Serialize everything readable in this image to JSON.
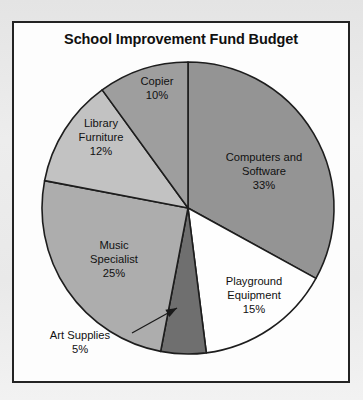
{
  "page": {
    "background_color": "#e9e9e9",
    "frame_background": "#fdfdfd",
    "frame_border_color": "#232323"
  },
  "chart_title": "School Improvement Fund Budget",
  "chart_data": {
    "type": "pie",
    "title": "School Improvement Fund Budget",
    "xlabel": "",
    "ylabel": "",
    "legend_position": "none",
    "grid": false,
    "total": 100,
    "units": "percent",
    "start_angle_deg": 0,
    "direction": "clockwise",
    "categories": [
      "Computers and Software",
      "Playground Equipment",
      "Art Supplies",
      "Music Specialist",
      "Library Furniture",
      "Copier"
    ],
    "values": [
      33,
      15,
      5,
      25,
      12,
      10
    ],
    "slices": [
      {
        "label": "Computers and",
        "label_line2": "Software",
        "full_label": "Computers and Software",
        "value": 33,
        "value_text": "33%",
        "color": "#949494",
        "label_placement": "inside",
        "label_x": 250,
        "label_y": 138
      },
      {
        "label": "Playground",
        "label_line2": "Equipment",
        "full_label": "Playground Equipment",
        "value": 15,
        "value_text": "15%",
        "color": "#fefefe",
        "label_placement": "inside",
        "label_x": 240,
        "label_y": 262
      },
      {
        "label": "Art Supplies",
        "label_line2": "",
        "full_label": "Art Supplies",
        "value": 5,
        "value_text": "5%",
        "color": "#6f6f6f",
        "label_placement": "callout",
        "label_x": 66,
        "label_y": 316
      },
      {
        "label": "Music",
        "label_line2": "Specialist",
        "full_label": "Music Specialist",
        "value": 25,
        "value_text": "25%",
        "color": "#adadad",
        "label_placement": "inside",
        "label_x": 100,
        "label_y": 226
      },
      {
        "label": "Library",
        "label_line2": "Furniture",
        "full_label": "Library Furniture",
        "value": 12,
        "value_text": "12%",
        "color": "#c2c2c2",
        "label_placement": "inside",
        "label_x": 87,
        "label_y": 104
      },
      {
        "label": "Copier",
        "label_line2": "",
        "full_label": "Copier",
        "value": 10,
        "value_text": "10%",
        "color": "#9e9e9e",
        "label_placement": "inside",
        "label_x": 143,
        "label_y": 62
      }
    ],
    "geometry": {
      "center_x": 174,
      "center_y": 185,
      "radius": 146
    },
    "callout": {
      "from_x": 118,
      "from_y": 310,
      "to_x": 163,
      "to_y": 285,
      "arrow_target": "Art Supplies"
    }
  }
}
